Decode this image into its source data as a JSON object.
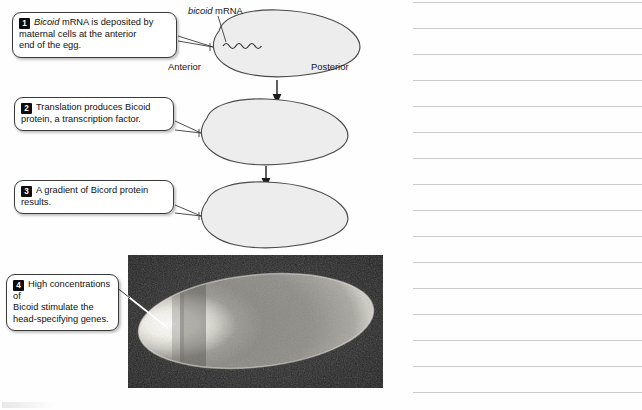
{
  "figure": {
    "title_label": "bicoid mRNA gradient figure",
    "anterior_label": "Anterior",
    "posterior_label": "Posterior",
    "mrna_label_italic": "bicoid",
    "mrna_label_rest": " mRNA",
    "egg_fill": "#ededee",
    "egg_stroke": "#4a4a4a",
    "steps": [
      {
        "number": "1",
        "text_italic": "Bicoid",
        "text": " mRNA is deposited by\nmaternal cells at the anterior\nend of the egg."
      },
      {
        "number": "2",
        "text_italic": "",
        "text": "Translation produces Bicoid\nprotein, a transcription factor."
      },
      {
        "number": "3",
        "text_italic": "",
        "text": "A gradient of Bicord protein\nresults."
      },
      {
        "number": "4",
        "text_italic": "",
        "text": "High concentrations of\nBicoid stimulate the\nhead-specifying genes."
      }
    ],
    "photo": {
      "caption": "micrograph of Drosophila egg showing Bicoid protein gradient",
      "background_color": "#2b2b2b",
      "bright_pole": "anterior"
    }
  },
  "notes": {
    "label": "blank ruled note lines",
    "line_color": "#c9cbcd",
    "line_count": 16,
    "first_line_y": 2,
    "line_spacing": 26
  }
}
